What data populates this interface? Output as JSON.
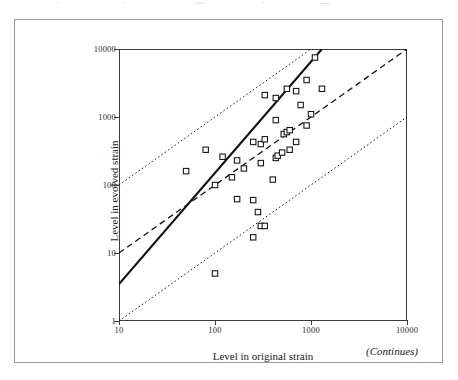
{
  "page": {
    "top_bleed_fragments": [
      "·",
      "·",
      "—",
      "·",
      "—"
    ],
    "continues_note": "(Continues)"
  },
  "chart_data": {
    "type": "scatter",
    "title": "",
    "xlabel": "Level in original strain",
    "ylabel": "Level in evolved strain",
    "xscale": "log",
    "yscale": "log",
    "xlim": [
      10,
      10000
    ],
    "ylim": [
      1,
      10000
    ],
    "xticks": [
      10,
      100,
      1000,
      10000
    ],
    "xtick_labels": [
      "10",
      "100",
      "1000",
      "10000"
    ],
    "yticks": [
      1,
      10,
      100,
      1000,
      10000
    ],
    "ytick_labels": [
      "1",
      "10",
      "100",
      "1000",
      "10000"
    ],
    "grid": false,
    "legend": "none",
    "marker_style": "open-square",
    "points": [
      {
        "x": 100,
        "y": 5
      },
      {
        "x": 250,
        "y": 17
      },
      {
        "x": 300,
        "y": 25
      },
      {
        "x": 330,
        "y": 25
      },
      {
        "x": 280,
        "y": 40
      },
      {
        "x": 170,
        "y": 62
      },
      {
        "x": 250,
        "y": 60
      },
      {
        "x": 100,
        "y": 100
      },
      {
        "x": 150,
        "y": 130
      },
      {
        "x": 50,
        "y": 160
      },
      {
        "x": 200,
        "y": 175
      },
      {
        "x": 400,
        "y": 120
      },
      {
        "x": 300,
        "y": 210
      },
      {
        "x": 120,
        "y": 260
      },
      {
        "x": 170,
        "y": 230
      },
      {
        "x": 80,
        "y": 330
      },
      {
        "x": 430,
        "y": 250
      },
      {
        "x": 450,
        "y": 270
      },
      {
        "x": 500,
        "y": 300
      },
      {
        "x": 600,
        "y": 330
      },
      {
        "x": 250,
        "y": 430
      },
      {
        "x": 300,
        "y": 400
      },
      {
        "x": 330,
        "y": 470
      },
      {
        "x": 700,
        "y": 430
      },
      {
        "x": 520,
        "y": 560
      },
      {
        "x": 560,
        "y": 600
      },
      {
        "x": 600,
        "y": 640
      },
      {
        "x": 430,
        "y": 900
      },
      {
        "x": 900,
        "y": 750
      },
      {
        "x": 1000,
        "y": 1100
      },
      {
        "x": 780,
        "y": 1500
      },
      {
        "x": 430,
        "y": 1900
      },
      {
        "x": 560,
        "y": 2600
      },
      {
        "x": 700,
        "y": 2400
      },
      {
        "x": 1300,
        "y": 2600
      },
      {
        "x": 900,
        "y": 3500
      },
      {
        "x": 1100,
        "y": 7500
      },
      {
        "x": 330,
        "y": 2100
      }
    ],
    "reference_lines": [
      {
        "name": "regression-fit",
        "style": "solid",
        "from": {
          "x": 10,
          "y": 3.5
        },
        "to": {
          "x": 1300,
          "y": 10000
        }
      },
      {
        "name": "identity-line",
        "style": "dashed",
        "from": {
          "x": 10,
          "y": 10
        },
        "to": {
          "x": 10000,
          "y": 10000
        }
      },
      {
        "name": "upper-band-10x",
        "style": "dotted",
        "from": {
          "x": 10,
          "y": 100
        },
        "to": {
          "x": 1000,
          "y": 10000
        }
      },
      {
        "name": "lower-band-10x",
        "style": "dotted",
        "from": {
          "x": 10,
          "y": 1
        },
        "to": {
          "x": 10000,
          "y": 1000
        }
      }
    ]
  }
}
